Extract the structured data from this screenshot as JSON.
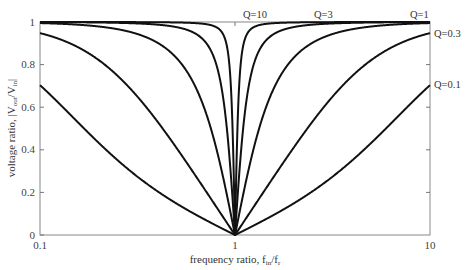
{
  "chart_data": {
    "type": "line",
    "title": "",
    "xlabel": "frequency ratio, f_in/f_r",
    "ylabel": "voltage ratio, |V_out/V_in|",
    "xscale": "log",
    "xlim": [
      0.1,
      10
    ],
    "ylim": [
      0,
      1
    ],
    "x_ticks": [
      "0.1",
      "1",
      "10"
    ],
    "y_ticks": [
      "0",
      "0.2",
      "0.4",
      "0.6",
      "0.8",
      "1"
    ],
    "grid": false,
    "formula": "|1 - r^2| / sqrt((1 - r^2)^2 + (r/Q)^2)",
    "series": [
      {
        "name": "Q=10",
        "Q": 10,
        "x": [
          0.1,
          0.5,
          0.9,
          0.95,
          0.99,
          1.0,
          1.01,
          1.05,
          1.1,
          2,
          10
        ],
        "values": [
          1.0,
          1.0,
          0.998,
          0.995,
          0.894,
          0.0,
          0.894,
          0.996,
          0.999,
          1.0,
          1.0
        ]
      },
      {
        "name": "Q=3",
        "Q": 3,
        "x": [
          0.1,
          0.5,
          0.8,
          0.9,
          0.95,
          1.0,
          1.05,
          1.1,
          1.25,
          2,
          10
        ],
        "values": [
          1.0,
          0.999,
          0.987,
          0.944,
          0.834,
          0.0,
          0.838,
          0.947,
          0.987,
          0.999,
          1.0
        ]
      },
      {
        "name": "Q=1",
        "Q": 1,
        "x": [
          0.1,
          0.3,
          0.5,
          0.7,
          0.9,
          1.0,
          1.11,
          1.43,
          2,
          3.33,
          10
        ],
        "values": [
          0.995,
          0.95,
          0.832,
          0.588,
          0.206,
          0.0,
          0.206,
          0.588,
          0.832,
          0.95,
          0.995
        ]
      },
      {
        "name": "Q=0.3",
        "Q": 0.3,
        "x": [
          0.1,
          0.2,
          0.3,
          0.5,
          0.7,
          1.0,
          1.43,
          2,
          3.33,
          5,
          10
        ],
        "values": [
          0.948,
          0.83,
          0.702,
          0.424,
          0.196,
          0.0,
          0.196,
          0.424,
          0.702,
          0.83,
          0.948
        ]
      },
      {
        "name": "Q=0.1",
        "Q": 0.1,
        "x": [
          0.1,
          0.2,
          0.3,
          0.5,
          0.7,
          1.0,
          1.43,
          2,
          3.33,
          5,
          10
        ],
        "values": [
          0.704,
          0.434,
          0.289,
          0.148,
          0.073,
          0.0,
          0.073,
          0.148,
          0.289,
          0.434,
          0.704
        ]
      }
    ],
    "annotations": [
      {
        "text": "Q=10",
        "position": "top, right of notch"
      },
      {
        "text": "Q=3",
        "position": "top"
      },
      {
        "text": "Q=1",
        "position": "top right"
      },
      {
        "text": "Q=0.3",
        "position": "right edge"
      },
      {
        "text": "Q=0.1",
        "position": "right edge"
      }
    ],
    "legend": "none (inline curve labels)"
  },
  "labels": {
    "xlabel_main": "frequency ratio, f",
    "xlabel_sub1": "in",
    "xlabel_mid": "/f",
    "xlabel_sub2": "r",
    "ylabel_main": "voltage ratio, |V",
    "ylabel_sub1": "out",
    "ylabel_mid": "/V",
    "ylabel_sub2": "in",
    "ylabel_end": "|",
    "q10": "Q=10",
    "q3": "Q=3",
    "q1": "Q=1",
    "q03": "Q=0.3",
    "q01": "Q=0.1",
    "xt0": "0.1",
    "xt1": "1",
    "xt2": "10",
    "yt0": "0",
    "yt1": "0.2",
    "yt2": "0.4",
    "yt3": "0.6",
    "yt4": "0.8",
    "yt5": "1"
  },
  "style": {
    "curve_color": "#111111",
    "axis_color": "#777777"
  }
}
